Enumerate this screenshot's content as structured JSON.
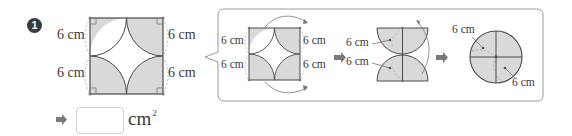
{
  "problem": {
    "number": "1",
    "main_figure": {
      "labels": {
        "left_top": "6 cm",
        "left_bottom": "6 cm",
        "right_top": "6 cm",
        "right_bottom": "6 cm"
      },
      "shape": "square with four quarter-circles at corners, shaded"
    },
    "hint_panel": {
      "step1": {
        "labels": {
          "left_top": "6 cm",
          "left_bottom": "6 cm",
          "right_top": "6 cm",
          "right_bottom": "6 cm"
        }
      },
      "step2": {
        "labels": {
          "top": "6 cm",
          "bottom": "6 cm"
        }
      },
      "step3": {
        "labels": {
          "top_left": "6 cm",
          "bottom_right": "6 cm"
        }
      }
    },
    "answer": {
      "value": "",
      "unit": "cm",
      "unit_exponent": "2"
    }
  },
  "colors": {
    "shade": "#d9d9d9",
    "line": "#4a4a4a",
    "dashed": "#aaaaaa",
    "arrow": "#7a7a7a",
    "panel_border": "#9a9a9a"
  }
}
